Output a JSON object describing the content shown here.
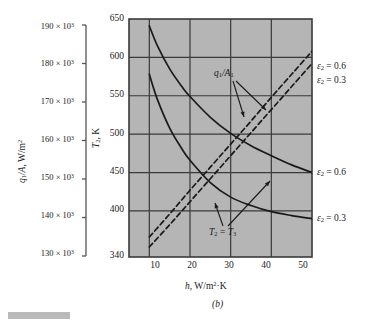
{
  "figure": {
    "panel_label": "(b)",
    "background": "#ffffff",
    "plot_background": "#b5b5b5",
    "grid_color": "#3a3a3a",
    "curve_color": "#1a1a1a"
  },
  "left_axis": {
    "title": "q₁/A, W/m²",
    "title_parts": {
      "q": "q",
      "sub1": "1",
      "slash_a": "/A, W/m",
      "sup2": "2"
    },
    "ticks": [
      "190",
      "180",
      "170",
      "160",
      "150",
      "140",
      "130"
    ],
    "multiplier": "× 10",
    "exponent": "3",
    "tick_labels": [
      "190 × 10³",
      "180 × 10³",
      "170 × 10³",
      "160 × 10³",
      "150 × 10³",
      "140 × 10³",
      "130 × 10³"
    ]
  },
  "inner_y_axis": {
    "title_var": "T",
    "title_sub": "2",
    "title_unit": ", K",
    "title": "T₂, K",
    "ticks": [
      "650",
      "600",
      "550",
      "500",
      "450",
      "400",
      "340"
    ],
    "range": [
      340,
      650
    ]
  },
  "x_axis": {
    "title_var": "h",
    "title_unit": ", W/m²·K",
    "title": "h, W/m²·K",
    "ticks": [
      "10",
      "20",
      "30",
      "40",
      "50"
    ],
    "range": [
      5,
      50
    ]
  },
  "annotations": {
    "q_over_a": {
      "var": "q",
      "sub": "1",
      "rest": "/A",
      "sub2": "1",
      "text": "q₁/A₁"
    },
    "t2_t3": {
      "var1": "T",
      "sub1": "2",
      "eq": " = ",
      "var2": "T",
      "sub2": "3",
      "text": "T₂ = T₃"
    }
  },
  "legend_labels": {
    "dashed_upper": "ε₂ = 0.6",
    "dashed_lower": "ε₂ = 0.3",
    "solid_upper": "ε₂ = 0.6",
    "solid_lower": "ε₂ = 0.3",
    "eps_sym": "ε",
    "eps_sub": "2",
    "val_06": " = 0.6",
    "val_03": " = 0.3"
  },
  "chart_data": {
    "type": "line",
    "title": "(b)",
    "xlabel": "h, W/m²·K",
    "ylabel": "T₂, K",
    "y2label": "q₁/A, W/m²",
    "xlim": [
      5,
      50
    ],
    "ylim": [
      340,
      650
    ],
    "y2lim": [
      130000,
      190000
    ],
    "grid": true,
    "legend_position": "right-of-axes",
    "xticks": [
      10,
      20,
      30,
      40,
      50
    ],
    "yticks": [
      340,
      400,
      450,
      500,
      550,
      600,
      650
    ],
    "y2ticks": [
      130000,
      140000,
      150000,
      160000,
      170000,
      180000,
      190000
    ],
    "series": [
      {
        "name": "T2 = T3, ε₂ = 0.6",
        "style": "solid",
        "annotation": "T₂ = T₃",
        "legend": "ε₂ = 0.6",
        "x": [
          10,
          12,
          15,
          18,
          20,
          25,
          30,
          35,
          40,
          45,
          50
        ],
        "y": [
          641,
          615,
          585,
          562,
          549,
          522,
          501,
          485,
          472,
          460,
          450
        ]
      },
      {
        "name": "T2 = T3, ε₂ = 0.3",
        "style": "solid",
        "annotation": "T₂ = T₃",
        "legend": "ε₂ = 0.3",
        "x": [
          10,
          12,
          15,
          18,
          20,
          25,
          30,
          35,
          40,
          45,
          50
        ],
        "y": [
          578,
          545,
          508,
          481,
          466,
          437,
          418,
          407,
          399,
          394,
          390
        ]
      },
      {
        "name": "q1/A1, ε₂ = 0.6",
        "style": "dashed",
        "annotation": "q₁/A₁",
        "legend": "ε₂ = 0.6",
        "x": [
          10,
          15,
          20,
          25,
          30,
          35,
          40,
          45,
          50
        ],
        "y": [
          366,
          396,
          427,
          457,
          487,
          517,
          548,
          578,
          608
        ]
      },
      {
        "name": "q1/A1, ε₂ = 0.3",
        "style": "dashed",
        "annotation": "q₁/A₁",
        "legend": "ε₂ = 0.3",
        "x": [
          10,
          15,
          20,
          25,
          30,
          35,
          40,
          45,
          50
        ],
        "y": [
          353,
          382,
          412,
          442,
          472,
          502,
          532,
          562,
          592
        ]
      }
    ]
  }
}
